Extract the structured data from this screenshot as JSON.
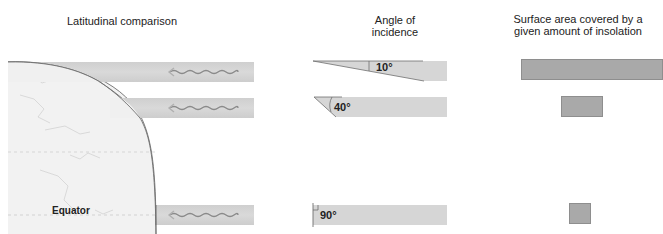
{
  "headings": {
    "latitudinal": "Latitudinal comparison",
    "angle": "Angle of incidence",
    "angle_line1": "Angle of",
    "angle_line2": "incidence",
    "area_line1": "Surface area covered by a",
    "area_line2": "given amount of insolation"
  },
  "globe": {
    "equator_label": "Equator"
  },
  "rows": [
    {
      "id": "high-latitude",
      "angle": "10°",
      "area_width_px": 142
    },
    {
      "id": "mid-latitude",
      "angle": "40°",
      "area_width_px": 42
    },
    {
      "id": "equator",
      "angle": "90°",
      "area_width_px": 22
    }
  ],
  "colors": {
    "beam": "#d4d4d4",
    "area": "#a9a9a9",
    "arrow": "#8a8a8a",
    "globe_fill": "#f2f2f2",
    "globe_outline": "#7a7a7a"
  }
}
